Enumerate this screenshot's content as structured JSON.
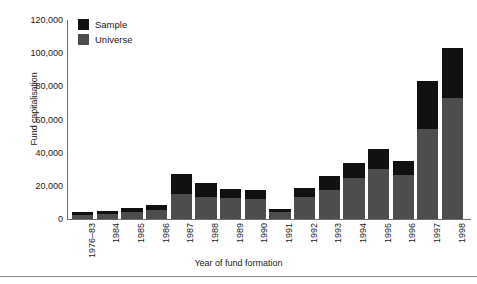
{
  "chart_data": {
    "type": "bar",
    "stacked": true,
    "title": "",
    "xlabel": "Year of fund formation",
    "ylabel": "Fund capitalisation",
    "ylim": [
      0,
      120000
    ],
    "ytick_step": 20000,
    "ytick_labels": [
      "120,000",
      "100,000",
      "80,000",
      "60,000",
      "40,000",
      "20,000",
      "0"
    ],
    "ytick_values": [
      120000,
      100000,
      80000,
      60000,
      40000,
      20000,
      0
    ],
    "grid": false,
    "legend_position": "top-left",
    "categories": [
      "1976–83",
      "1984",
      "1985",
      "1986",
      "1987",
      "1988",
      "1989",
      "1990",
      "1991",
      "1992",
      "1993",
      "1994",
      "1995",
      "1996",
      "1997",
      "1998"
    ],
    "series": [
      {
        "name": "Universe",
        "color": "#4d4d4d",
        "values": [
          2500,
          3200,
          4200,
          5500,
          15000,
          13500,
          12500,
          12000,
          4200,
          13000,
          17500,
          24500,
          30000,
          26500,
          54000,
          73000
        ]
      },
      {
        "name": "Sample",
        "color": "#111111",
        "values": [
          1500,
          1800,
          2300,
          3000,
          12000,
          8000,
          5500,
          5500,
          1800,
          6000,
          8500,
          9000,
          12000,
          8500,
          29500,
          30000
        ]
      }
    ],
    "totals": [
      4000,
      5000,
      6500,
      8500,
      27000,
      21500,
      18000,
      17500,
      6000,
      19000,
      26000,
      33500,
      42000,
      35000,
      83500,
      103000
    ]
  },
  "legend": {
    "entries": [
      {
        "label": "Sample",
        "color": "#111111",
        "swatch_name": "legend-swatch-sample"
      },
      {
        "label": "Universe",
        "color": "#4d4d4d",
        "swatch_name": "legend-swatch-universe"
      }
    ]
  }
}
